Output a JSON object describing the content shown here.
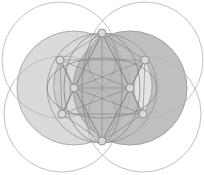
{
  "canvas": {
    "width": 204,
    "height": 175,
    "background": "#ffffff",
    "title": "Overlapping circles geometric construction"
  },
  "palette": {
    "background": "#ffffff",
    "outline_light": "#b9b9b9",
    "outline_mid": "#9a9a9a",
    "outline_dark": "#7e7e7e",
    "fill_lightest": "#ffffff",
    "fill_light": "#e0e0e0",
    "fill_mid_light": "#cfcfcf",
    "fill_mid": "#c0c0c0",
    "fill_mid_dark": "#b0b0b0",
    "fill_dark": "#9e9e9e",
    "node_fill": "#d8d8d8",
    "node_stroke": "#8a8a8a"
  },
  "chart_data": {
    "type": "diagram",
    "title": "Overlapping circles geometric construction",
    "xlabel": "",
    "ylabel": "",
    "grid": false,
    "legend": null,
    "circles": [
      {
        "name": "outline-circle-upper-left",
        "cx": 60,
        "cy": 60,
        "r": 58,
        "fill": "none",
        "stroke": "#b9b9b9",
        "stroke_width": 0.9
      },
      {
        "name": "outline-circle-upper-right",
        "cx": 145,
        "cy": 60,
        "r": 58,
        "fill": "none",
        "stroke": "#b9b9b9",
        "stroke_width": 0.9
      },
      {
        "name": "outline-circle-lower-left",
        "cx": 62,
        "cy": 114,
        "r": 58,
        "fill": "none",
        "stroke": "#b9b9b9",
        "stroke_width": 0.9
      },
      {
        "name": "outline-circle-lower-right",
        "cx": 143,
        "cy": 114,
        "r": 58,
        "fill": "none",
        "stroke": "#b9b9b9",
        "stroke_width": 0.9
      },
      {
        "name": "shaded-circle-left",
        "cx": 74,
        "cy": 88,
        "r": 57,
        "fill": "#d3d3d3",
        "stroke": "#a5a5a5",
        "stroke_width": 0.9,
        "opacity": 0.85
      },
      {
        "name": "shaded-circle-right",
        "cx": 130,
        "cy": 88,
        "r": 57,
        "fill": "#b4b4b4",
        "stroke": "#9a9a9a",
        "stroke_width": 0.9,
        "opacity": 0.85
      },
      {
        "name": "central-circle",
        "cx": 102,
        "cy": 88,
        "r": 55,
        "fill": "none",
        "stroke": "#9a9a9a",
        "stroke_width": 0.9
      }
    ],
    "ellipses": [
      {
        "name": "ellipse-horizontal-wide",
        "cx": 102,
        "cy": 88,
        "rx": 55,
        "ry": 30,
        "stroke": "#8f8f8f",
        "stroke_width": 0.9
      },
      {
        "name": "ellipse-vertical-narrow",
        "cx": 102,
        "cy": 88,
        "rx": 20,
        "ry": 55,
        "stroke": "#8f8f8f",
        "stroke_width": 0.9
      },
      {
        "name": "ellipse-vertical-mid",
        "cx": 102,
        "cy": 88,
        "rx": 38,
        "ry": 55,
        "stroke": "#8f8f8f",
        "stroke_width": 0.9
      }
    ],
    "nodes": [
      {
        "id": "n-top",
        "label": "top vertex",
        "cx": 102,
        "cy": 33,
        "r": 4.0
      },
      {
        "id": "n-upper-left",
        "label": "upper left vertex",
        "cx": 60,
        "cy": 60,
        "r": 4.0
      },
      {
        "id": "n-upper-right",
        "label": "upper right vertex",
        "cx": 145,
        "cy": 60,
        "r": 4.0
      },
      {
        "id": "n-mid-left",
        "label": "middle left vertex",
        "cx": 74,
        "cy": 88,
        "r": 4.0
      },
      {
        "id": "n-mid-right",
        "label": "middle right vertex",
        "cx": 130,
        "cy": 88,
        "r": 4.0
      },
      {
        "id": "n-lower-left",
        "label": "lower left vertex",
        "cx": 62,
        "cy": 114,
        "r": 4.0
      },
      {
        "id": "n-lower-right",
        "label": "lower right vertex",
        "cx": 143,
        "cy": 114,
        "r": 4.0
      },
      {
        "id": "n-bottom",
        "label": "bottom vertex",
        "cx": 102,
        "cy": 141,
        "r": 4.0
      }
    ],
    "edges": [
      {
        "from": "n-top",
        "to": "n-upper-left"
      },
      {
        "from": "n-top",
        "to": "n-upper-right"
      },
      {
        "from": "n-top",
        "to": "n-mid-left"
      },
      {
        "from": "n-top",
        "to": "n-mid-right"
      },
      {
        "from": "n-top",
        "to": "n-lower-left"
      },
      {
        "from": "n-top",
        "to": "n-lower-right"
      },
      {
        "from": "n-top",
        "to": "n-bottom"
      },
      {
        "from": "n-upper-left",
        "to": "n-upper-right"
      },
      {
        "from": "n-upper-left",
        "to": "n-mid-left"
      },
      {
        "from": "n-upper-left",
        "to": "n-mid-right"
      },
      {
        "from": "n-upper-left",
        "to": "n-lower-left"
      },
      {
        "from": "n-upper-left",
        "to": "n-bottom"
      },
      {
        "from": "n-upper-right",
        "to": "n-mid-left"
      },
      {
        "from": "n-upper-right",
        "to": "n-mid-right"
      },
      {
        "from": "n-upper-right",
        "to": "n-lower-right"
      },
      {
        "from": "n-upper-right",
        "to": "n-bottom"
      },
      {
        "from": "n-mid-left",
        "to": "n-mid-right"
      },
      {
        "from": "n-mid-left",
        "to": "n-lower-left"
      },
      {
        "from": "n-mid-left",
        "to": "n-lower-right"
      },
      {
        "from": "n-mid-left",
        "to": "n-bottom"
      },
      {
        "from": "n-mid-right",
        "to": "n-lower-left"
      },
      {
        "from": "n-mid-right",
        "to": "n-lower-right"
      },
      {
        "from": "n-mid-right",
        "to": "n-bottom"
      },
      {
        "from": "n-lower-left",
        "to": "n-lower-right"
      },
      {
        "from": "n-lower-left",
        "to": "n-bottom"
      },
      {
        "from": "n-lower-right",
        "to": "n-bottom"
      }
    ],
    "lens_shapes": [
      {
        "name": "lens-left-upper",
        "d": "M 102 33 Q 74 60 102 88 Q 130 60 102 33",
        "fill": "#bfbfbf"
      },
      {
        "name": "lens-left-lower",
        "d": "M 102 88 Q 74 114 102 141 Q 130 114 102 88",
        "fill": "#bfbfbf"
      },
      {
        "name": "lens-far-left",
        "d": "M 60 60 Q 46 88 62 114 Q 80 88 60 60",
        "fill": "#cacaca"
      },
      {
        "name": "lens-far-right",
        "d": "M 145 60 Q 160 88 143 114 Q 124 88 145 60",
        "fill": "#efefef"
      }
    ]
  }
}
